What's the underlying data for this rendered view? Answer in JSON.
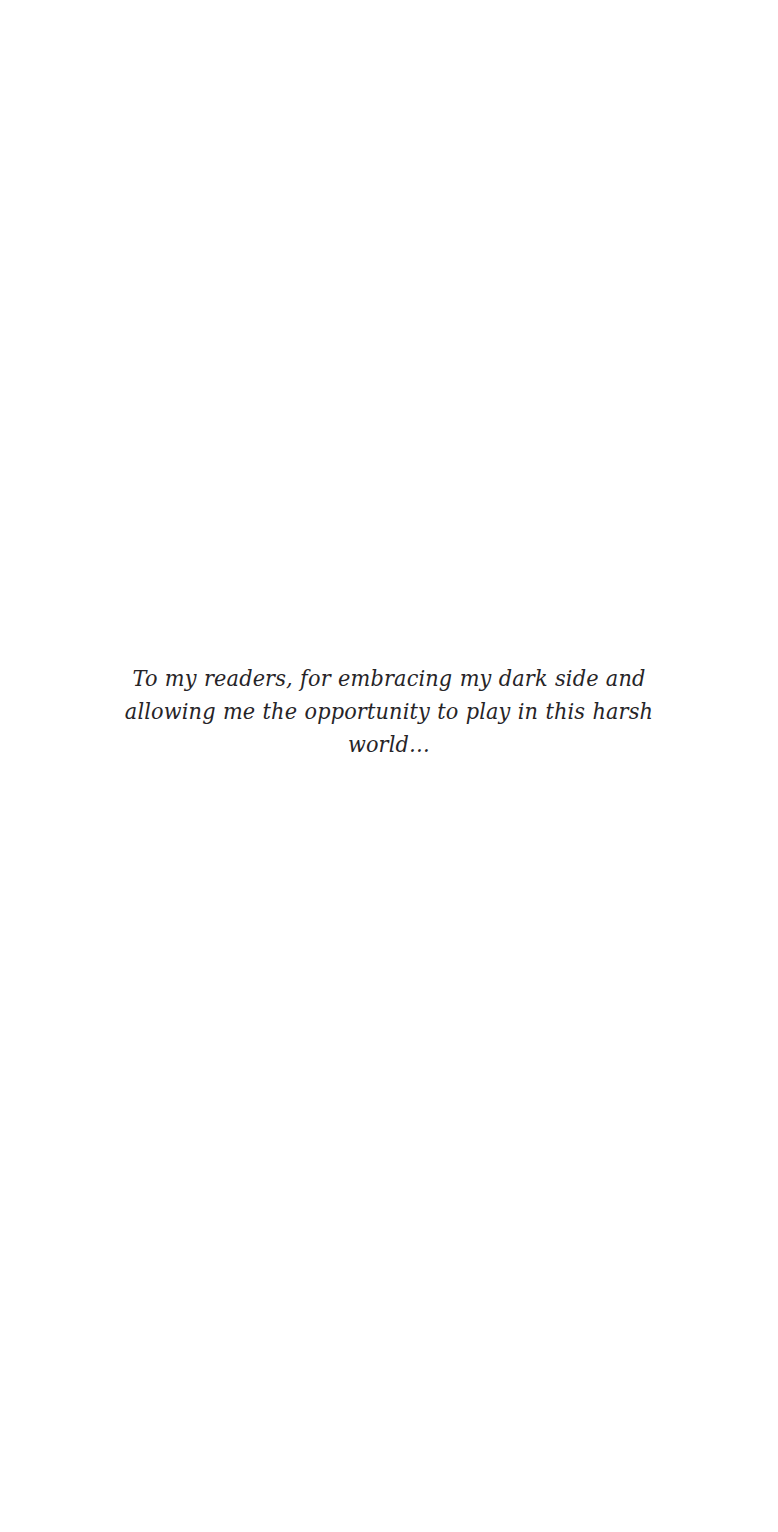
{
  "page": {
    "kind": "book-dedication-page",
    "background_color": "#ffffff",
    "ink_color": "#262427"
  },
  "dedication": {
    "text": "To my readers, for embracing my dark side and allowing me the opportunity to play in this harsh world…",
    "lines": [
      "To my readers, for embracing my dark side and allowing me the",
      "opportunity to play in this harsh world…"
    ]
  }
}
